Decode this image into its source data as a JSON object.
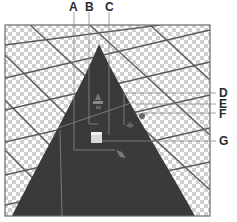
{
  "figure": {
    "type": "3d-axis-widget-callout-diagram",
    "colors": {
      "cone": "#3a3a3a",
      "frame": "#6a6a6a",
      "grid_line": "#5a5a5a",
      "checker_light": "#ffffff",
      "checker_dark": "#cfcfcf",
      "leader_line": "#8a8a8a",
      "label_text": "#2a2a2a"
    }
  },
  "callouts": [
    {
      "id": "A",
      "label": "A"
    },
    {
      "id": "B",
      "label": "B"
    },
    {
      "id": "C",
      "label": "C"
    },
    {
      "id": "D",
      "label": "D"
    },
    {
      "id": "E",
      "label": "E"
    },
    {
      "id": "F",
      "label": "F"
    },
    {
      "id": "G",
      "label": "G"
    }
  ]
}
